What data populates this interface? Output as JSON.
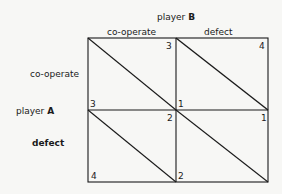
{
  "title": {
    "player_b": "player",
    "player_b_letter": "B",
    "player_a": "player",
    "player_a_letter": "A"
  },
  "columns": [
    {
      "label": "co-operate"
    },
    {
      "label": "defect"
    }
  ],
  "rows": [
    {
      "label": "co-operate"
    },
    {
      "label": "defect"
    }
  ],
  "cells": [
    {
      "row": "co-operate",
      "col": "co-operate",
      "payoff_b": "3",
      "payoff_a": "3"
    },
    {
      "row": "co-operate",
      "col": "defect",
      "payoff_b": "4",
      "payoff_a": "1"
    },
    {
      "row": "defect",
      "col": "co-operate",
      "payoff_b": "2",
      "payoff_a": "4"
    },
    {
      "row": "defect",
      "col": "defect",
      "payoff_b": "1",
      "payoff_a": "2"
    }
  ]
}
